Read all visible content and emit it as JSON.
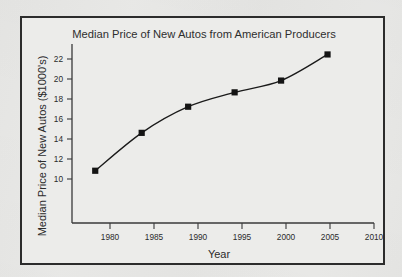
{
  "chart_data": {
    "type": "line",
    "title": "Median Price of New Autos from American Producers",
    "xlabel": "Year",
    "ylabel": "Median Price of New Autos ($1000's)",
    "x": [
      1980,
      1985,
      1990,
      1995,
      2000,
      2005
    ],
    "values": [
      12.9,
      15.8,
      17.8,
      18.9,
      19.8,
      21.8
    ],
    "series": [
      {
        "name": "Median Price of New Autos",
        "values": [
          12.9,
          15.8,
          17.8,
          18.9,
          19.8,
          21.8
        ]
      }
    ],
    "xlim": [
      1977.5,
      2010
    ],
    "ylim": [
      8.9,
      22.6
    ],
    "xticks": [
      1980,
      1985,
      1990,
      1995,
      2000,
      2005,
      2010
    ],
    "xtick_labels": [
      "1980",
      "1985",
      "1990",
      "1995",
      "2000",
      "2005",
      "2010"
    ],
    "yticks": [
      10,
      12,
      14,
      16,
      18,
      20,
      22
    ],
    "ytick_labels": [
      "10",
      "12",
      "14",
      "16",
      "18",
      "20",
      "22"
    ],
    "grid": false,
    "legend": null,
    "marker": "square",
    "line_color": "#141414",
    "marker_color": "#141414",
    "background_color": "#e9e9e7",
    "frame_color": "#2c2c2c"
  }
}
